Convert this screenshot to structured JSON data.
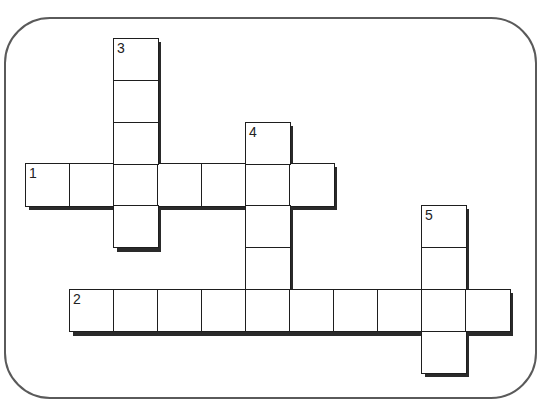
{
  "puzzle": {
    "type": "crossword",
    "cell_size": 44,
    "frame": {
      "border_color": "#5a5a5a",
      "background": "#ffffff"
    },
    "clue_numbers": [
      "1",
      "2",
      "3",
      "4",
      "5"
    ],
    "words": [
      {
        "number": "1",
        "direction": "across",
        "length": 7,
        "start_col": 0,
        "start_row": 3
      },
      {
        "number": "2",
        "direction": "across",
        "length": 10,
        "start_col": 1,
        "start_row": 6
      },
      {
        "number": "3",
        "direction": "down",
        "length": 5,
        "start_col": 2,
        "start_row": 0
      },
      {
        "number": "4",
        "direction": "down",
        "length": 5,
        "start_col": 5,
        "start_row": 2
      },
      {
        "number": "5",
        "direction": "down",
        "length": 4,
        "start_col": 9,
        "start_row": 4
      }
    ]
  }
}
